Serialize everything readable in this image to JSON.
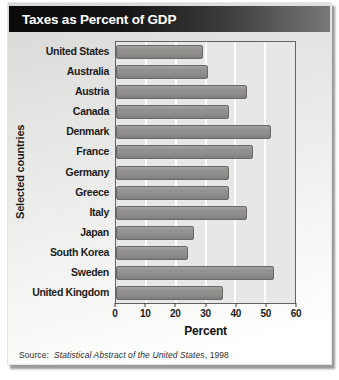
{
  "title": "Taxes as Percent of GDP",
  "source": {
    "prefix": "Source:",
    "work": "Statistical Abstract of the United States",
    "suffix": ", 1998"
  },
  "colors": {
    "title_bar_left": "#0a0a0a",
    "title_bar_right": "#787878",
    "bar_fill": "#8f8f8d",
    "bar_border": "#696965",
    "plot_background": "#e7e7e5",
    "gridline": "#ffffff",
    "card_top": "#d7d7d5",
    "card_bottom": "#ffffff"
  },
  "chart_data": {
    "type": "bar",
    "orientation": "horizontal",
    "title": "Taxes as Percent of GDP",
    "xlabel": "Percent",
    "ylabel": "Selected countries",
    "xlim": [
      0,
      60
    ],
    "xticks": [
      0,
      10,
      20,
      30,
      40,
      50,
      60
    ],
    "grid": true,
    "categories": [
      "United States",
      "Australia",
      "Austria",
      "Canada",
      "Denmark",
      "France",
      "Germany",
      "Greece",
      "Italy",
      "Japan",
      "South Korea",
      "Sweden",
      "United Kingdom"
    ],
    "values": [
      29,
      31,
      44,
      38,
      52,
      46,
      38,
      38,
      44,
      26,
      24,
      53,
      36
    ]
  }
}
